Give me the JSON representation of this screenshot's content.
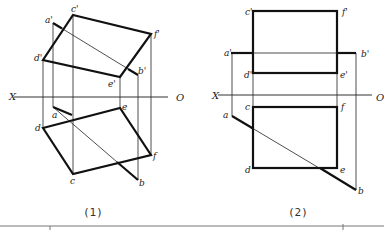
{
  "figures": [
    {
      "caption": "(1)",
      "axis": {
        "left": "X",
        "right": "O"
      },
      "labels": {
        "a_v": "a'",
        "b_v": "b'",
        "c_v": "c'",
        "d_v": "d'",
        "e_v": "e'",
        "f_v": "f'",
        "a_h": "a",
        "b_h": "b",
        "c_h": "c",
        "d_h": "d",
        "e_h": "e",
        "f_h": "f"
      }
    },
    {
      "caption": "(2)",
      "axis": {
        "left": "X",
        "right": "O"
      },
      "labels": {
        "a_v": "a'",
        "b_v": "b'",
        "c_v": "c'",
        "d_v": "d'",
        "e_v": "e'",
        "f_v": "f'",
        "a_h": "a",
        "b_h": "b",
        "c_h": "c",
        "d_h": "d",
        "e_h": "e",
        "f_h": "f"
      }
    }
  ]
}
